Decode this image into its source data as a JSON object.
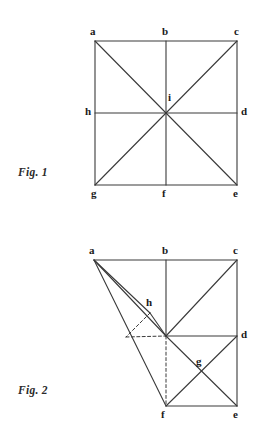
{
  "page": {
    "width": 266,
    "height": 435,
    "background": "#ffffff",
    "ink_color": "#3a3a3a",
    "label_color": "#1a1a1a"
  },
  "figures": [
    {
      "id": "fig1",
      "caption": "Fig. 1",
      "caption_pos": {
        "x": 18,
        "y": 166
      },
      "description": "Square with both diagonals, a vertical median and a horizontal median, all meeting at centre i.",
      "vertices": [
        {
          "name": "a",
          "label": "a",
          "x": 95,
          "y": 41,
          "label_x": 90,
          "label_y": 26
        },
        {
          "name": "b",
          "label": "b",
          "x": 166,
          "y": 41,
          "label_x": 162,
          "label_y": 26
        },
        {
          "name": "c",
          "label": "c",
          "x": 237,
          "y": 41,
          "label_x": 234,
          "label_y": 26
        },
        {
          "name": "d",
          "label": "d",
          "x": 237,
          "y": 113,
          "label_x": 241,
          "label_y": 106
        },
        {
          "name": "e",
          "label": "e",
          "x": 237,
          "y": 185,
          "label_x": 233,
          "label_y": 188
        },
        {
          "name": "f",
          "label": "f",
          "x": 166,
          "y": 185,
          "label_x": 162,
          "label_y": 188
        },
        {
          "name": "g",
          "label": "g",
          "x": 95,
          "y": 185,
          "label_x": 91,
          "label_y": 188
        },
        {
          "name": "h",
          "label": "h",
          "x": 95,
          "y": 113,
          "label_x": 85,
          "label_y": 106
        },
        {
          "name": "i",
          "label": "i",
          "x": 166,
          "y": 113,
          "label_x": 168,
          "label_y": 92
        }
      ],
      "solid_edges": [
        [
          "a",
          "c"
        ],
        [
          "c",
          "e"
        ],
        [
          "e",
          "g"
        ],
        [
          "g",
          "a"
        ],
        [
          "h",
          "d"
        ],
        [
          "b",
          "f"
        ],
        [
          "a",
          "e"
        ],
        [
          "c",
          "g"
        ]
      ],
      "dashed_edges": []
    },
    {
      "id": "fig2",
      "caption": "Fig. 2",
      "caption_pos": {
        "x": 18,
        "y": 384
      },
      "description": "Same square folded: vertex g has been swung down-right to f, producing the skew quadrilateral a-c-e-f with auxiliary point h and intersection g.",
      "vertices": [
        {
          "name": "a",
          "label": "a",
          "x": 94,
          "y": 260,
          "label_x": 89,
          "label_y": 245
        },
        {
          "name": "b",
          "label": "b",
          "x": 166,
          "y": 260,
          "label_x": 162,
          "label_y": 245
        },
        {
          "name": "c",
          "label": "c",
          "x": 237,
          "y": 260,
          "label_x": 233,
          "label_y": 245
        },
        {
          "name": "d",
          "label": "d",
          "x": 237,
          "y": 336,
          "label_x": 241,
          "label_y": 329
        },
        {
          "name": "e",
          "label": "e",
          "x": 237,
          "y": 406,
          "label_x": 233,
          "label_y": 409
        },
        {
          "name": "f",
          "label": "f",
          "x": 166,
          "y": 406,
          "label_x": 161,
          "label_y": 409
        },
        {
          "name": "h",
          "label": "h",
          "x": 150,
          "y": 313,
          "label_x": 146,
          "label_y": 297
        },
        {
          "name": "i",
          "label": "",
          "x": 166,
          "y": 336,
          "label_x": 0,
          "label_y": 0
        },
        {
          "name": "k",
          "label": "",
          "x": 126,
          "y": 337,
          "label_x": 0,
          "label_y": 0
        },
        {
          "name": "g",
          "label": "g",
          "x": 197,
          "y": 370,
          "label_x": 196,
          "label_y": 356
        }
      ],
      "solid_edges": [
        [
          "a",
          "c"
        ],
        [
          "c",
          "e"
        ],
        [
          "e",
          "f"
        ],
        [
          "a",
          "f"
        ],
        [
          "a",
          "h"
        ],
        [
          "a",
          "i"
        ],
        [
          "h",
          "i"
        ],
        [
          "b",
          "i"
        ],
        [
          "i",
          "d"
        ],
        [
          "c",
          "i"
        ],
        [
          "i",
          "e"
        ],
        [
          "f",
          "d"
        ]
      ],
      "dashed_edges": [
        [
          "h",
          "k"
        ],
        [
          "k",
          "i"
        ],
        [
          "i",
          "f"
        ]
      ]
    }
  ]
}
